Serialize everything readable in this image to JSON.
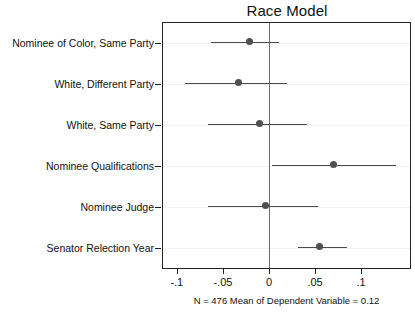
{
  "chart_data": {
    "type": "scatter",
    "title": "Race Model",
    "xlabel": "",
    "ylabel": "",
    "xlim": [
      -0.115,
      0.153
    ],
    "xticks": [
      -0.1,
      -0.05,
      0,
      0.05,
      0.1
    ],
    "xticklabels": [
      "-.1",
      "-.05",
      "0",
      ".05",
      ".1"
    ],
    "grid": true,
    "legend": null,
    "reference_line": 0,
    "annotation": "N = 476 Mean of Dependent Variable = 0.12",
    "categories": [
      "Nominee of Color, Same Party",
      "White, Different Party",
      "White, Same Party",
      "Nominee Qualifications",
      "Nominee Judge",
      "Senator Relection Year"
    ],
    "values": [
      -0.021,
      -0.033,
      -0.01,
      0.07,
      -0.004,
      0.055
    ],
    "ci_low": [
      -0.063,
      -0.091,
      -0.066,
      0.003,
      -0.066,
      0.031
    ],
    "ci_high": [
      0.011,
      0.02,
      0.041,
      0.138,
      0.053,
      0.085
    ]
  }
}
